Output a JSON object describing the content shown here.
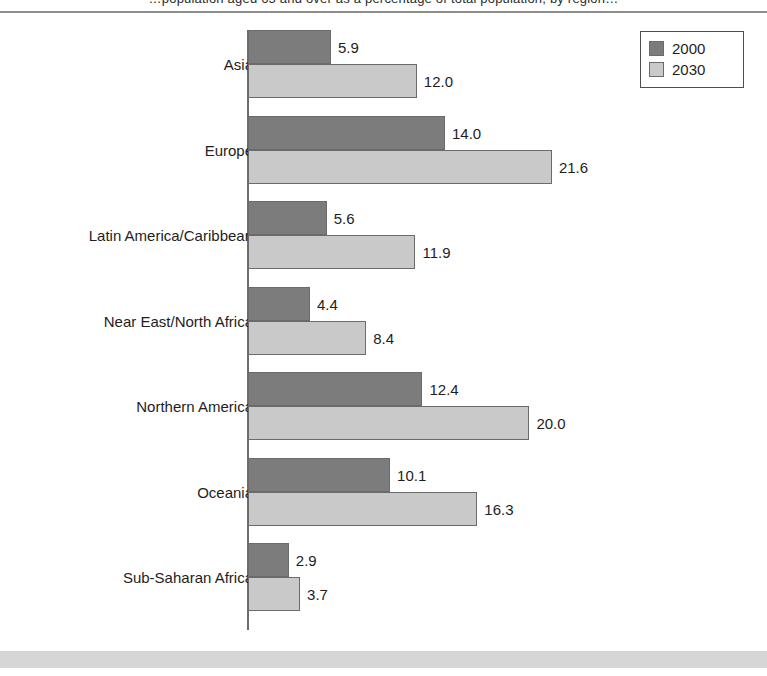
{
  "page": {
    "clipped_header_text": "…population aged 65 and over as a percentage of total population, by region…",
    "background_color": "#ffffff",
    "rule_color": "#8d8d8d",
    "band_color": "#d6d6d6"
  },
  "legend": {
    "position": "top-right",
    "entries": [
      {
        "label": "2000",
        "color": "#7c7c7c",
        "icon": "square-swatch-icon"
      },
      {
        "label": "2030",
        "color": "#c9c9c9",
        "icon": "square-swatch-icon"
      }
    ]
  },
  "chart_data": {
    "type": "bar",
    "orientation": "horizontal",
    "title": "",
    "subtitle": "",
    "xlabel": "",
    "ylabel": "",
    "grid": false,
    "legend_position": "top-right",
    "xlim": [
      0,
      24
    ],
    "categories": [
      "Asia",
      "Europe",
      "Latin America/Caribbean",
      "Near East/North Africa",
      "Northern America",
      "Oceania",
      "Sub-Saharan Africa"
    ],
    "series": [
      {
        "name": "2000",
        "color": "#7c7c7c",
        "values": [
          5.9,
          14.0,
          5.6,
          4.4,
          12.4,
          10.1,
          2.9
        ],
        "labels": [
          "5.9",
          "14.0",
          "5.6",
          "4.4",
          "12.4",
          "10.1",
          "2.9"
        ]
      },
      {
        "name": "2030",
        "color": "#c9c9c9",
        "values": [
          12.0,
          21.6,
          11.9,
          8.4,
          20.0,
          16.3,
          3.7
        ],
        "labels": [
          "12.0",
          "21.6",
          "11.9",
          "8.4",
          "20.0",
          "16.3",
          "3.7"
        ]
      }
    ]
  }
}
